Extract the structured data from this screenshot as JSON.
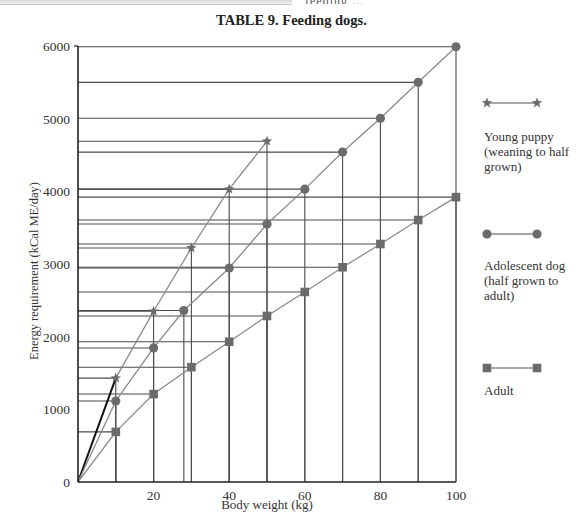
{
  "page": {
    "top_text_fragment": "feeding ...",
    "title": "TABLE 9. Feeding dogs."
  },
  "legend": {
    "items": [
      {
        "key": "young_puppy",
        "label": "Young puppy (weaning to half grown)",
        "marker": "star",
        "color": "#7a7a7a"
      },
      {
        "key": "adolescent",
        "label": "Adolescent dog (half grown to adult)",
        "marker": "circle",
        "color": "#6e6e6e"
      },
      {
        "key": "adult",
        "label": "Adult",
        "marker": "square",
        "color": "#6e6e6e"
      }
    ]
  },
  "colors": {
    "axis": "#222222",
    "gridline": "#4a4a4a",
    "series_line": "#8a8a8a",
    "origin_puppy_line": "#111111",
    "marker": "#6b6b6b"
  },
  "chart_data": {
    "type": "line",
    "title": "TABLE 9. Feeding dogs.",
    "xlabel": "Body weight (kg)",
    "ylabel": "Energy requirement (kCal ME/day)",
    "xlim": [
      0,
      100
    ],
    "ylim": [
      0,
      6000
    ],
    "x_ticks": [
      "20",
      "40",
      "60",
      "80",
      "100"
    ],
    "y_ticks": [
      "0",
      "1000",
      "2000",
      "3000",
      "4000",
      "5000",
      "6000"
    ],
    "origin_label": "0",
    "grid": "drop-lines from each data point to both axes",
    "legend_position": "right",
    "series": [
      {
        "name": "Young puppy (weaning to half grown)",
        "marker": "star",
        "x": [
          10,
          20,
          30,
          40,
          50
        ],
        "y": [
          1430,
          2350,
          3220,
          4030,
          4690
        ]
      },
      {
        "name": "Adolescent dog (half grown to adult)",
        "marker": "circle",
        "x": [
          10,
          20,
          28,
          40,
          50,
          60,
          70,
          80,
          90,
          100
        ],
        "y": [
          1115,
          1845,
          2360,
          2945,
          3550,
          4030,
          4540,
          5005,
          5500,
          5990
        ]
      },
      {
        "name": "Adult",
        "marker": "square",
        "x": [
          10,
          20,
          30,
          40,
          50,
          60,
          70,
          80,
          90,
          100
        ],
        "y": [
          690,
          1210,
          1580,
          1930,
          2285,
          2615,
          2955,
          3275,
          3605,
          3920
        ]
      }
    ]
  }
}
